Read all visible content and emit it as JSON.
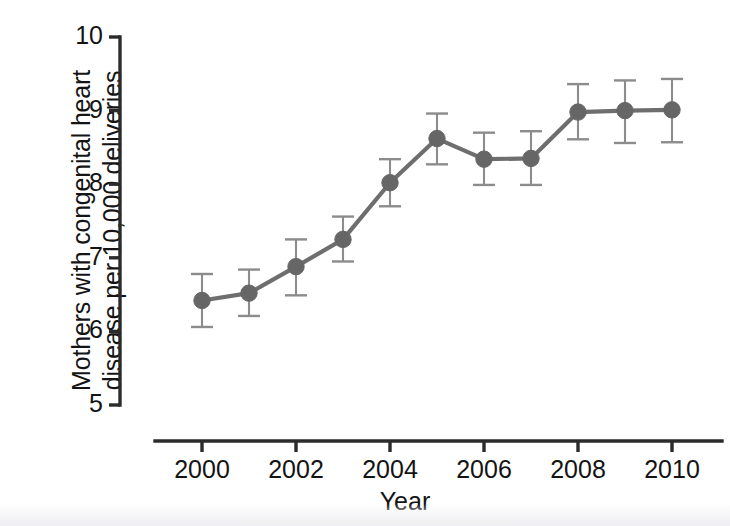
{
  "chart_data": {
    "type": "line",
    "title": "",
    "subtitle": "",
    "xlabel": "Year",
    "ylabel": "Mothers with congenital heart\ndisease per 10,000 deliveries",
    "x": [
      2000,
      2001,
      2002,
      2003,
      2004,
      2005,
      2006,
      2007,
      2008,
      2009,
      2010
    ],
    "values": [
      6.42,
      6.52,
      6.88,
      7.25,
      8.02,
      8.62,
      8.34,
      8.35,
      8.98,
      9.0,
      9.01
    ],
    "error_low": [
      6.06,
      6.21,
      6.49,
      6.95,
      7.7,
      8.27,
      7.99,
      7.99,
      8.61,
      8.56,
      8.57
    ],
    "error_high": [
      6.78,
      6.84,
      7.25,
      7.56,
      8.34,
      8.96,
      8.7,
      8.72,
      9.36,
      9.41,
      9.43
    ],
    "series": [
      {
        "name": "Mothers with congenital heart disease",
        "values": [
          6.42,
          6.52,
          6.88,
          7.25,
          8.02,
          8.62,
          8.34,
          8.35,
          8.98,
          9.0,
          9.01
        ]
      }
    ],
    "xlim": [
      1999.1,
      2011.1
    ],
    "ylim": [
      5,
      10
    ],
    "xticks": [
      2000,
      2002,
      2004,
      2006,
      2008,
      2010
    ],
    "xtick_labels": [
      "2000",
      "2002",
      "2004",
      "2006",
      "2008",
      "2010"
    ],
    "yticks": [
      5,
      6,
      7,
      8,
      9,
      10
    ],
    "ytick_labels": [
      "5",
      "6",
      "7",
      "8",
      "9",
      "10"
    ],
    "grid": false,
    "legend": "none",
    "marker": "circle",
    "error_bars": "vertical-capped",
    "colors": {
      "line": "#6e6e6e",
      "marker": "#666666",
      "error_bar": "#8c8c8c",
      "axis": "#2b2b2b",
      "text": "#141414",
      "background": "#ffffff"
    }
  },
  "axes": {
    "y_axis_name": "y-axis",
    "x_axis_name": "x-axis"
  }
}
